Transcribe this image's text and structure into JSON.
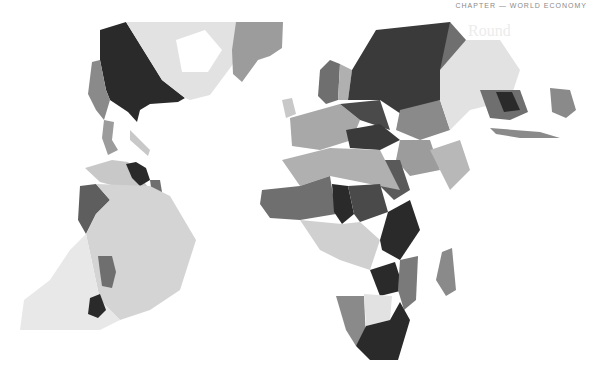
{
  "page": {
    "header_text": "CHAPTER — WORLD ECONOMY",
    "bleed_through_heading": "Round"
  },
  "map": {
    "type": "choropleth",
    "title": "",
    "palette": {
      "ocean": "#ffffff",
      "level_1": "#e2e2e2",
      "level_2": "#c8c8c8",
      "level_3": "#9c9c9c",
      "level_4": "#6f6f6f",
      "level_5": "#2a2a2a"
    },
    "regions": [
      {
        "name": "North America (west)",
        "level": 5
      },
      {
        "name": "Canada (east)",
        "level": 1
      },
      {
        "name": "Greenland",
        "level": 3
      },
      {
        "name": "Central America",
        "level": 3
      },
      {
        "name": "Venezuela",
        "level": 5
      },
      {
        "name": "Brazil",
        "level": 1
      },
      {
        "name": "Peru",
        "level": 4
      },
      {
        "name": "Paraguay",
        "level": 4
      },
      {
        "name": "Uruguay",
        "level": 5
      },
      {
        "name": "Scandinavia",
        "level": 4
      },
      {
        "name": "Russia",
        "level": 5
      },
      {
        "name": "Kazakhstan",
        "level": 3
      },
      {
        "name": "Mongolia/China",
        "level": 1
      },
      {
        "name": "Southeast Asia",
        "level": 4
      },
      {
        "name": "Australia region",
        "level": 3
      },
      {
        "name": "North Africa",
        "level": 3
      },
      {
        "name": "Sahel",
        "level": 4
      },
      {
        "name": "Chad",
        "level": 5
      },
      {
        "name": "Central Africa",
        "level": 1
      },
      {
        "name": "East Africa",
        "level": 5
      },
      {
        "name": "Namibia",
        "level": 3
      },
      {
        "name": "Botswana",
        "level": 1
      },
      {
        "name": "South Africa",
        "level": 5
      },
      {
        "name": "Madagascar",
        "level": 3
      }
    ]
  }
}
